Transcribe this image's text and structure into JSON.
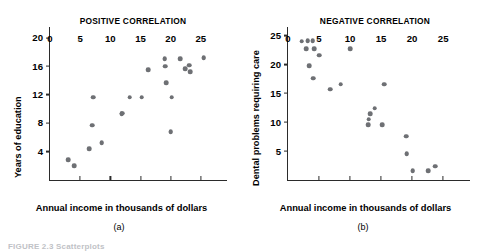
{
  "figure": {
    "caption": "FIGURE 2.3   Scatterplots",
    "panels": [
      {
        "key": "a",
        "sublabel": "(a)"
      },
      {
        "key": "b",
        "sublabel": "(b)"
      }
    ]
  },
  "chart_data": [
    {
      "type": "scatter",
      "title": "POSITIVE CORRELATION",
      "panel_label": "(a)",
      "xlabel": "Annual income in thousands of dollars",
      "ylabel": "Years of education",
      "xlim": [
        0,
        29
      ],
      "ylim": [
        0,
        21.5
      ],
      "xticks": [
        0,
        5,
        10,
        15,
        20,
        25
      ],
      "yticks": [
        4,
        8,
        12,
        16,
        20
      ],
      "grid": false,
      "legend": "none",
      "marker_color": "#6e7074",
      "points": [
        {
          "x": 3.0,
          "y": 2.8
        },
        {
          "x": 4.0,
          "y": 2.0
        },
        {
          "x": 6.5,
          "y": 4.4
        },
        {
          "x": 7.0,
          "y": 7.7
        },
        {
          "x": 8.6,
          "y": 5.2
        },
        {
          "x": 7.2,
          "y": 11.6
        },
        {
          "x": 11.9,
          "y": 9.3
        },
        {
          "x": 13.2,
          "y": 11.6
        },
        {
          "x": 15.2,
          "y": 11.6
        },
        {
          "x": 16.3,
          "y": 15.5
        },
        {
          "x": 20.0,
          "y": 6.8
        },
        {
          "x": 20.2,
          "y": 11.6
        },
        {
          "x": 19.3,
          "y": 13.7
        },
        {
          "x": 19.0,
          "y": 17.0
        },
        {
          "x": 19.1,
          "y": 16.0
        },
        {
          "x": 21.6,
          "y": 17.0
        },
        {
          "x": 22.4,
          "y": 15.6
        },
        {
          "x": 23.1,
          "y": 16.1
        },
        {
          "x": 23.2,
          "y": 15.2
        },
        {
          "x": 25.5,
          "y": 17.2
        },
        {
          "x": 12.0,
          "y": 9.4
        }
      ]
    },
    {
      "type": "scatter",
      "title": "NEGATIVE CORRELATION",
      "panel_label": "(b)",
      "xlabel": "Annual income in thousands of dollars",
      "ylabel": "Dental problems requiring care",
      "xlim": [
        0,
        29
      ],
      "ylim": [
        0,
        26.5
      ],
      "xticks": [
        0,
        5,
        10,
        15,
        20,
        25
      ],
      "yticks": [
        5,
        10,
        15,
        20,
        25
      ],
      "grid": false,
      "legend": "none",
      "marker_color": "#6e7074",
      "points": [
        {
          "x": 2.2,
          "y": 24.0
        },
        {
          "x": 3.2,
          "y": 24.1
        },
        {
          "x": 4.0,
          "y": 24.1
        },
        {
          "x": 2.9,
          "y": 22.7
        },
        {
          "x": 4.2,
          "y": 22.7
        },
        {
          "x": 5.0,
          "y": 21.6
        },
        {
          "x": 3.4,
          "y": 19.8
        },
        {
          "x": 4.1,
          "y": 17.6
        },
        {
          "x": 6.8,
          "y": 15.7
        },
        {
          "x": 8.5,
          "y": 16.6
        },
        {
          "x": 10.0,
          "y": 22.7
        },
        {
          "x": 13.0,
          "y": 10.5
        },
        {
          "x": 12.9,
          "y": 9.6
        },
        {
          "x": 14.0,
          "y": 12.4
        },
        {
          "x": 15.2,
          "y": 9.6
        },
        {
          "x": 15.5,
          "y": 16.6
        },
        {
          "x": 19.0,
          "y": 7.6
        },
        {
          "x": 19.1,
          "y": 4.5
        },
        {
          "x": 20.1,
          "y": 1.6
        },
        {
          "x": 22.6,
          "y": 1.6
        },
        {
          "x": 23.7,
          "y": 2.4
        },
        {
          "x": 13.2,
          "y": 11.5
        }
      ]
    }
  ]
}
